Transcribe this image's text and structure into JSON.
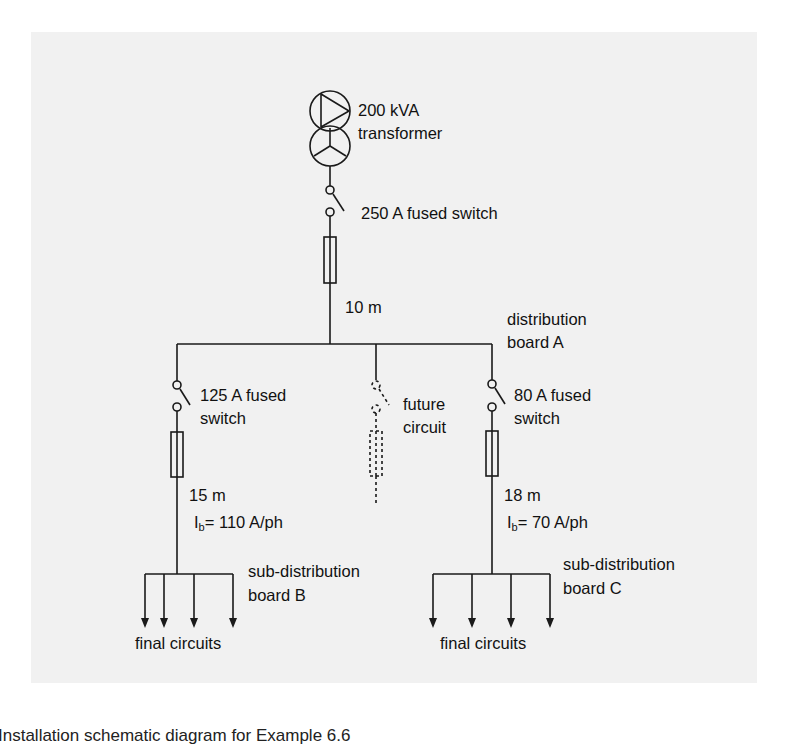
{
  "figure": {
    "source": {
      "rating_label": "200 kVA",
      "type_label": "transformer"
    },
    "main_switch": {
      "label": "250 A fused switch"
    },
    "main_cable": {
      "length_label": "10 m"
    },
    "main_board": {
      "line1": "distribution",
      "line2": "board A"
    },
    "branches": [
      {
        "id": "B",
        "switch_line1": "125 A fused",
        "switch_line2": "switch",
        "length_label": "15 m",
        "current_symbol": "I",
        "current_subscript": "b",
        "current_value": "= 110 A/ph",
        "board_line1": "sub-distribution",
        "board_line2": "board B",
        "final_label": "final circuits",
        "final_circuit_count": 4
      },
      {
        "id": "future",
        "label_line1": "future",
        "label_line2": "circuit",
        "dashed": true
      },
      {
        "id": "C",
        "switch_line1": "80 A fused",
        "switch_line2": "switch",
        "length_label": "18 m",
        "current_symbol": "I",
        "current_subscript": "b",
        "current_value": "= 70 A/ph",
        "board_line1": "sub-distribution",
        "board_line2": "board C",
        "final_label": "final circuits",
        "final_circuit_count": 4
      }
    ],
    "caption": "Installation schematic diagram for Example 6.6"
  },
  "colors": {
    "panel_background": "#f1f1f1",
    "page_background": "#ffffff",
    "line": "#1a1a1a"
  }
}
